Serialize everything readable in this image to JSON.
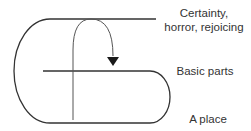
{
  "diagram": {
    "labels": {
      "top": [
        "Certainty,",
        "horror, rejoicing"
      ],
      "middle": "Basic parts",
      "bottom": "A place"
    },
    "colors": {
      "stroke": "#333333",
      "arrow": "#1a1a1a",
      "text": "#333333"
    }
  }
}
